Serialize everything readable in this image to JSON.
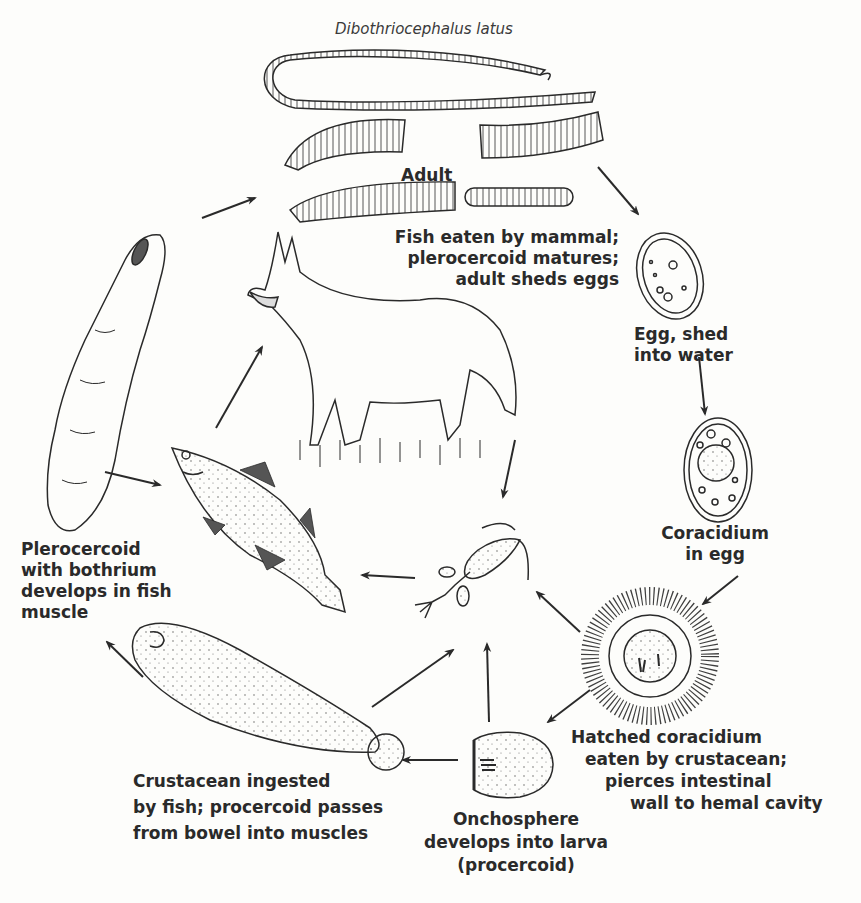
{
  "title": "Dibothriocephalus latus",
  "stages": {
    "adult": {
      "label": "Adult"
    },
    "mammal": {
      "lines": [
        "Fish eaten by mammal;",
        "plerocercoid matures;",
        "adult sheds eggs"
      ]
    },
    "egg": {
      "lines": [
        "Egg, shed",
        "into water"
      ]
    },
    "coracidium_egg": {
      "lines": [
        "Coracidium",
        "in egg"
      ]
    },
    "hatched": {
      "lines": [
        "Hatched coracidium",
        "eaten by crustacean;",
        "pierces intestinal",
        "wall to hemal cavity"
      ]
    },
    "onchosphere": {
      "lines": [
        "Onchosphere",
        "develops into larva",
        "(procercoid)"
      ]
    },
    "crustacean_ingested": {
      "lines": [
        "Crustacean ingested",
        "by fish; procercoid passes",
        "from bowel into muscles"
      ]
    },
    "plerocercoid": {
      "lines": [
        "Plerocercoid",
        "with bothrium",
        "develops in fish",
        "muscle"
      ]
    }
  },
  "colors": {
    "ink": "#2a2a2a",
    "paper": "#fdfdfb"
  }
}
